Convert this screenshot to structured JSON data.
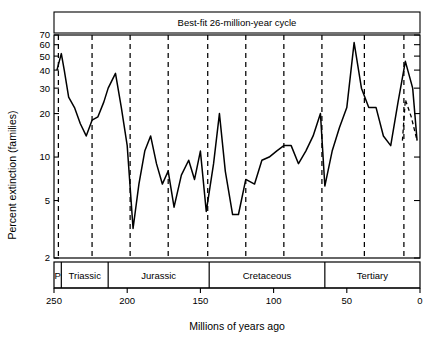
{
  "chart_data": {
    "type": "line",
    "title": "Best-fit 26-million-year cycle",
    "xlabel": "Millions of years ago",
    "ylabel": "Percent extinction (families)",
    "xlim": [
      250,
      0
    ],
    "ylim": [
      2,
      70
    ],
    "yscale": "log",
    "xticks": [
      250,
      200,
      150,
      100,
      50,
      0
    ],
    "xtick_labels": [
      "250",
      "200",
      "150",
      "100",
      "50",
      "0"
    ],
    "yticks": [
      2,
      5,
      10,
      20,
      30,
      40,
      50,
      60,
      70
    ],
    "ytick_labels": [
      "2",
      "5",
      "10",
      "20",
      "30",
      "40",
      "50",
      "60",
      "70"
    ],
    "grid": false,
    "legend": "none",
    "series": [
      {
        "name": "Percent extinction of marine families",
        "x": [
          248,
          245,
          243,
          240,
          236,
          232,
          228,
          224,
          220,
          216,
          213,
          208,
          204,
          200,
          196,
          192,
          188,
          184,
          180,
          176,
          172,
          168,
          163,
          158,
          154,
          150,
          146,
          141,
          137,
          133,
          128,
          124,
          119,
          113,
          108,
          103,
          98,
          93,
          88,
          83,
          78,
          73,
          68,
          65,
          60,
          55,
          50,
          45,
          40,
          35,
          30,
          25,
          20,
          15,
          10,
          5,
          2
        ],
        "y": [
          40,
          52,
          40,
          26,
          22,
          17,
          14,
          18,
          19,
          24,
          30,
          38,
          22,
          12,
          3.2,
          6.5,
          11,
          14,
          9,
          6.5,
          8,
          4.5,
          7.5,
          9.5,
          7,
          11,
          4.2,
          9,
          20,
          8,
          4,
          4,
          7,
          6.5,
          9.5,
          10,
          11,
          12,
          12,
          9,
          11,
          14,
          20,
          6.3,
          11,
          16,
          22,
          62,
          30,
          22,
          22,
          14,
          12,
          24,
          46,
          30,
          13
        ],
        "style": "solid"
      },
      {
        "name": "Extrapolated trend",
        "x": [
          12,
          10,
          6,
          2
        ],
        "y": [
          13,
          25,
          19,
          13
        ],
        "style": "partly-dashed"
      }
    ],
    "cycle_lines": {
      "label": "Best-fit 26-million-year cycle",
      "period_myr": 26,
      "style": "dashed",
      "positions": [
        247,
        224,
        198,
        172,
        145,
        119,
        93,
        67,
        38,
        11
      ]
    },
    "period_bands": [
      {
        "label": "P",
        "start": 250,
        "end": 245
      },
      {
        "label": "Triassic",
        "start": 245,
        "end": 213
      },
      {
        "label": "Jurassic",
        "start": 213,
        "end": 144
      },
      {
        "label": "Cretaceous",
        "start": 144,
        "end": 65
      },
      {
        "label": "Tertiary",
        "start": 65,
        "end": 0
      }
    ]
  },
  "colors": {
    "line": "#000000",
    "axis": "#000000",
    "background": "#ffffff"
  }
}
